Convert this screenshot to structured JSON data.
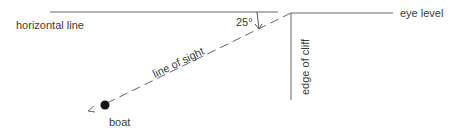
{
  "diagram": {
    "labels": {
      "horizontal_line": "horizontal line",
      "eye_level": "eye level",
      "angle": "25°",
      "line_of_sight": "line of sight",
      "edge_of_cliff": "edge of cliff",
      "boat": "boat"
    },
    "angle_degrees": 25,
    "colors": {
      "line": "#555555",
      "text": "#3a3a3a",
      "boat": "#111111"
    }
  }
}
